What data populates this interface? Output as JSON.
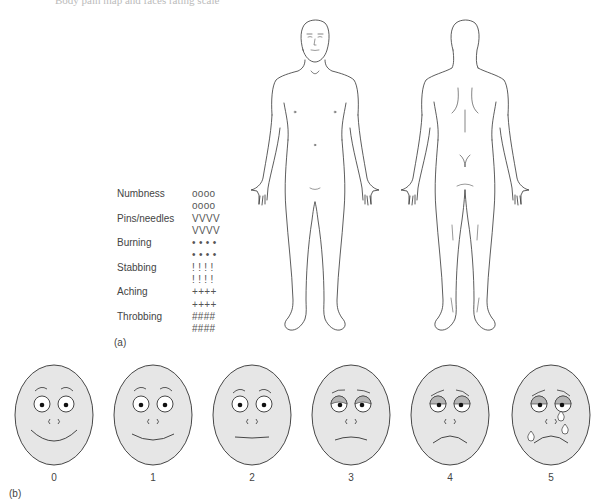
{
  "header": {
    "clipped_caption": "Body pain map and faces rating scale"
  },
  "part_a": {
    "label": "(a)",
    "figures": [
      {
        "name": "front-view",
        "description": "Anterior body outline"
      },
      {
        "name": "back-view",
        "description": "Posterior body outline"
      }
    ],
    "legend": [
      {
        "label": "Numbness",
        "symbol": "oooo"
      },
      {
        "label": "",
        "symbol": "oooo"
      },
      {
        "label": "Pins/needles",
        "symbol": "VVVV"
      },
      {
        "label": "",
        "symbol": "VVVV"
      },
      {
        "label": "Burning",
        "symbol": "• • • •"
      },
      {
        "label": "",
        "symbol": "• • • •"
      },
      {
        "label": "Stabbing",
        "symbol": "! ! ! !"
      },
      {
        "label": "",
        "symbol": "! ! ! !"
      },
      {
        "label": "Aching",
        "symbol": "++++"
      },
      {
        "label": "",
        "symbol": "++++"
      },
      {
        "label": "Throbbing",
        "symbol": "####"
      },
      {
        "label": "",
        "symbol": "####"
      }
    ]
  },
  "part_b": {
    "label": "(b)",
    "faces": [
      {
        "score": "0",
        "expression": "big-smile"
      },
      {
        "score": "1",
        "expression": "smile"
      },
      {
        "score": "2",
        "expression": "neutral"
      },
      {
        "score": "3",
        "expression": "slight-frown"
      },
      {
        "score": "4",
        "expression": "frown"
      },
      {
        "score": "5",
        "expression": "crying"
      }
    ]
  },
  "colors": {
    "face_fill": "#e6e6e6",
    "line": "#333333",
    "eye_shadow": "#b5b5b5"
  }
}
